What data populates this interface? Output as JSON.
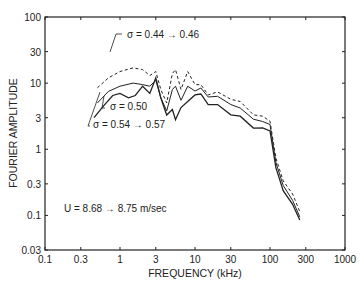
{
  "chart_data": {
    "type": "line",
    "title": "",
    "xlabel": "FREQUENCY (kHz)",
    "ylabel": "FOURIER AMPLITUDE",
    "xscale": "log",
    "yscale": "log",
    "xlim": [
      0.1,
      1000
    ],
    "ylim": [
      0.03,
      100
    ],
    "x_ticks": [
      0.1,
      0.3,
      1,
      3,
      10,
      30,
      100,
      300,
      1000
    ],
    "x_tick_labels": [
      "0.1",
      "0.3",
      "1",
      "3",
      "10",
      "30",
      "100",
      "300",
      "1000"
    ],
    "y_ticks": [
      0.03,
      0.1,
      0.3,
      1,
      3,
      10,
      30,
      100
    ],
    "y_tick_labels": [
      "0.03",
      "0.1",
      "0.3",
      "1",
      "3",
      "10",
      "30",
      "100"
    ],
    "grid": false,
    "legend": "none (inline annotations)",
    "annotations": [
      {
        "text": "σ = 0.44 → 0.46",
        "x": 2.3,
        "y": 21
      },
      {
        "text": "σ = 0.50",
        "x": 1.0,
        "y": 4.9
      },
      {
        "text": "σ = 0.54 → 0.57",
        "x": 0.45,
        "y": 2.4
      },
      {
        "text": "U = 8.68 → 8.75 m/sec",
        "x": 0.3,
        "y": 0.13
      }
    ],
    "series": [
      {
        "name": "σ = 0.44 → 0.46",
        "style": "dashed",
        "x": [
          0.5,
          0.7,
          1.0,
          1.5,
          2.0,
          2.5,
          3.0,
          3.5,
          4.2,
          5.0,
          5.5,
          6.5,
          8.0,
          10,
          12,
          15,
          20,
          30,
          40,
          60,
          80,
          100,
          120,
          150,
          200,
          250
        ],
        "y": [
          8.5,
          12,
          15,
          17,
          16,
          13,
          15,
          8,
          5,
          14,
          16,
          8,
          15,
          10,
          9,
          7,
          7,
          6,
          5,
          3.5,
          3,
          2.8,
          0.7,
          0.35,
          0.2,
          0.12
        ]
      },
      {
        "name": "σ = 0.50",
        "style": "solid",
        "x": [
          0.5,
          0.7,
          1.0,
          1.5,
          2.0,
          2.5,
          3.0,
          3.5,
          4.2,
          5.0,
          5.5,
          6.5,
          8.0,
          10,
          12,
          15,
          20,
          30,
          40,
          60,
          80,
          100,
          120,
          150,
          200,
          250
        ],
        "y": [
          5,
          7.5,
          9,
          10,
          9.5,
          9,
          11,
          6,
          3.8,
          8,
          9,
          5.5,
          9,
          8,
          8,
          6.5,
          6,
          5,
          4,
          3,
          2.5,
          2.5,
          0.6,
          0.3,
          0.16,
          0.1
        ]
      },
      {
        "name": "σ = 0.54 → 0.57",
        "style": "solid",
        "x": [
          0.45,
          0.6,
          0.8,
          1.0,
          1.3,
          1.6,
          2.0,
          2.5,
          3.0,
          3.5,
          4.2,
          5.0,
          5.5,
          6.5,
          8.0,
          10,
          12,
          15,
          20,
          30,
          40,
          60,
          80,
          100,
          120,
          150,
          200,
          250
        ],
        "y": [
          3,
          4.5,
          6.5,
          7,
          6,
          6.5,
          9,
          7,
          12,
          6,
          3.3,
          4,
          2.8,
          4.5,
          5,
          7,
          6.5,
          5,
          4.5,
          3.5,
          3,
          2.2,
          2,
          2,
          0.5,
          0.25,
          0.14,
          0.09
        ]
      }
    ]
  },
  "labels": {
    "xlabel": "FREQUENCY (kHz)",
    "ylabel": "FOURIER AMPLITUDE",
    "ann1": "σ = 0.44 → 0.46",
    "ann2": "σ = 0.50",
    "ann3": "σ = 0.54 → 0.57",
    "ann4": "U = 8.68 → 8.75 m/sec"
  }
}
